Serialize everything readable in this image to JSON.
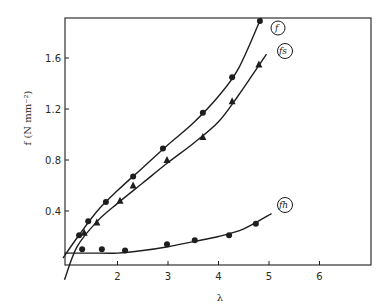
{
  "chart_data": {
    "type": "scatter",
    "title": "",
    "xlabel": "λ",
    "ylabel": "f (N mm⁻²)",
    "xlim": [
      0.95,
      7.0
    ],
    "ylim": [
      -0.14,
      1.92
    ],
    "x_ticks": [
      2,
      3,
      4,
      5,
      6
    ],
    "x_tick_labels": [
      "2",
      "3",
      "4",
      "5",
      "6"
    ],
    "y_ticks": [
      0.4,
      0.8,
      1.2,
      1.6
    ],
    "y_tick_labels": [
      "0.4",
      "0.8",
      "1.2",
      "1.6"
    ],
    "grid": false,
    "legend": "inline circled labels at curve ends",
    "series": [
      {
        "name": "f",
        "label": "f",
        "marker": "circle",
        "points": [
          [
            1.24,
            0.21
          ],
          [
            1.42,
            0.32
          ],
          [
            1.77,
            0.47
          ],
          [
            2.31,
            0.67
          ],
          [
            2.9,
            0.89
          ],
          [
            3.69,
            1.17
          ],
          [
            4.27,
            1.45
          ],
          [
            4.82,
            1.89
          ]
        ],
        "fit": [
          [
            0.92,
            0.03
          ],
          [
            1.2,
            0.19
          ],
          [
            1.6,
            0.4
          ],
          [
            2.0,
            0.56
          ],
          [
            2.5,
            0.74
          ],
          [
            3.0,
            0.92
          ],
          [
            3.5,
            1.09
          ],
          [
            4.0,
            1.3
          ],
          [
            4.4,
            1.52
          ],
          [
            4.85,
            1.92
          ]
        ]
      },
      {
        "name": "fs",
        "label": "fs",
        "marker": "triangle",
        "points": [
          [
            1.34,
            0.23
          ],
          [
            1.59,
            0.31
          ],
          [
            2.05,
            0.48
          ],
          [
            2.31,
            0.6
          ],
          [
            2.98,
            0.8
          ],
          [
            3.69,
            0.98
          ],
          [
            4.27,
            1.26
          ],
          [
            4.8,
            1.55
          ]
        ],
        "fit": [
          [
            0.95,
            -0.14
          ],
          [
            1.2,
            0.12
          ],
          [
            1.6,
            0.32
          ],
          [
            2.0,
            0.46
          ],
          [
            2.5,
            0.62
          ],
          [
            3.0,
            0.78
          ],
          [
            3.5,
            0.93
          ],
          [
            4.0,
            1.1
          ],
          [
            4.4,
            1.31
          ],
          [
            4.95,
            1.63
          ]
        ]
      },
      {
        "name": "fh",
        "label": "fh",
        "marker": "circle",
        "points": [
          [
            1.3,
            0.1
          ],
          [
            1.69,
            0.1
          ],
          [
            2.15,
            0.09
          ],
          [
            2.98,
            0.14
          ],
          [
            3.53,
            0.17
          ],
          [
            4.21,
            0.21
          ],
          [
            4.74,
            0.3
          ]
        ],
        "fit": [
          [
            0.95,
            0.07
          ],
          [
            1.5,
            0.07
          ],
          [
            2.0,
            0.07
          ],
          [
            2.5,
            0.09
          ],
          [
            3.0,
            0.12
          ],
          [
            3.5,
            0.16
          ],
          [
            4.0,
            0.2
          ],
          [
            4.5,
            0.26
          ],
          [
            5.05,
            0.38
          ]
        ]
      }
    ]
  }
}
